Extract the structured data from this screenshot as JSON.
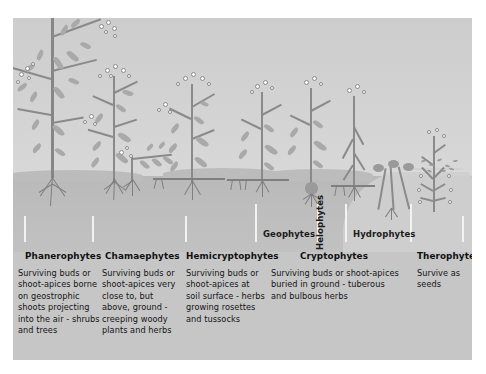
{
  "figure": {
    "background_color": "#ffffff",
    "panel_color": "#c9c9c9",
    "ink_color": "#8a8a8a",
    "bud_color": "#ffffff",
    "text_color": "#141414"
  },
  "zones": {
    "air_label": "air",
    "soil_label": "soil",
    "water_label": "water"
  },
  "sub_labels": [
    {
      "name": "geophytes",
      "text": "Geophytes",
      "orientation": "horizontal"
    },
    {
      "name": "helophytes",
      "text": "Helophytes",
      "orientation": "vertical"
    },
    {
      "name": "hydrophytes",
      "text": "Hydrophytes",
      "orientation": "horizontal"
    }
  ],
  "columns": [
    {
      "id": "phanerophytes",
      "label": "Phanerophytes",
      "description": "Surviving buds or shoot-apices borne on geostrophic shoots projecting into the air - shrubs and trees"
    },
    {
      "id": "chamaephytes",
      "label": "Chamaephytes",
      "description": "Surviving buds or shoot-apices very close to, but above, ground - creeping woody plants and herbs"
    },
    {
      "id": "hemicryptophytes",
      "label": "Hemicryptophytes",
      "description": "Surviving buds or shoot-apices at soil surface - herbs growing rosettes and tussocks"
    },
    {
      "id": "cryptophytes",
      "label": "Cryptophytes",
      "description": "Surviving buds or shoot-apices buried in ground - tuberous and bulbous herbs"
    },
    {
      "id": "therophytes",
      "label": "Therophytes",
      "description": "Survive as seeds"
    }
  ]
}
